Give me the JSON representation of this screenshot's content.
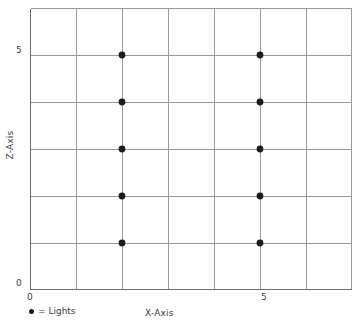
{
  "chart_data": {
    "type": "scatter",
    "title": "",
    "xlabel": "X-Axis",
    "ylabel": "Z-Axis",
    "xlim": [
      0,
      7
    ],
    "ylim": [
      0,
      6
    ],
    "grid": true,
    "x_ticks": [
      0,
      5
    ],
    "x_tick_labels": [
      "0",
      "5"
    ],
    "y_ticks": [
      0,
      5
    ],
    "y_tick_labels": [
      "0",
      "5"
    ],
    "x_gridlines": [
      0,
      1,
      2,
      3,
      4,
      5,
      6,
      7
    ],
    "y_gridlines": [
      0,
      1,
      2,
      3,
      4,
      5,
      6
    ],
    "legend_position": "below-left",
    "series": [
      {
        "name": "Lights",
        "marker": "circle",
        "color": "#1c1c1c",
        "points": [
          {
            "x": 2,
            "z": 5
          },
          {
            "x": 2,
            "z": 4
          },
          {
            "x": 2,
            "z": 3
          },
          {
            "x": 2,
            "z": 2
          },
          {
            "x": 2,
            "z": 1
          },
          {
            "x": 5,
            "z": 5
          },
          {
            "x": 5,
            "z": 4
          },
          {
            "x": 5,
            "z": 3
          },
          {
            "x": 5,
            "z": 2
          },
          {
            "x": 5,
            "z": 1
          }
        ]
      }
    ]
  },
  "axes": {
    "x_title": "X-Axis",
    "y_title": "Z-Axis",
    "x_tick_0": "0",
    "x_tick_5": "5",
    "y_tick_0": "0",
    "y_tick_5": "5"
  },
  "legend": {
    "equals": "= Lights"
  },
  "colors": {
    "grid": "#9a9a9a",
    "border": "#6e6e6e",
    "marker": "#1c1c1c",
    "text": "#3d3d3d",
    "background": "#ffffff"
  }
}
